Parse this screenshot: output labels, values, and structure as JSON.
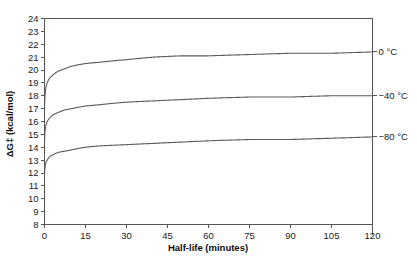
{
  "chart_data": {
    "type": "line",
    "title": "",
    "xlabel": "Half-life (minutes)",
    "ylabel": "ΔG‡ (kcal/mol)",
    "xlim": [
      0,
      120
    ],
    "ylim": [
      8,
      24
    ],
    "xticks": [
      "0",
      "15",
      "30",
      "45",
      "60",
      "75",
      "90",
      "105",
      "120"
    ],
    "xtick_values": [
      0,
      15,
      30,
      45,
      60,
      75,
      90,
      105,
      120
    ],
    "yticks": [
      "8",
      "9",
      "10",
      "11",
      "12",
      "13",
      "14",
      "15",
      "16",
      "17",
      "18",
      "19",
      "20",
      "21",
      "22",
      "23",
      "24"
    ],
    "ytick_values": [
      8,
      9,
      10,
      11,
      12,
      13,
      14,
      15,
      16,
      17,
      18,
      19,
      20,
      21,
      22,
      23,
      24
    ],
    "grid": false,
    "legend_position": "right-inline",
    "series": [
      {
        "name": "0 °C",
        "label": "0 °C",
        "color": "#5a5a5a",
        "x": [
          0.05,
          0.25,
          0.5,
          1,
          2,
          3,
          5,
          7.5,
          10,
          15,
          20,
          30,
          40,
          50,
          60,
          75,
          90,
          105,
          120
        ],
        "values": [
          17.3,
          18.2,
          18.6,
          19.0,
          19.4,
          19.6,
          19.9,
          20.1,
          20.3,
          20.5,
          20.6,
          20.8,
          21.0,
          21.1,
          21.1,
          21.2,
          21.3,
          21.3,
          21.4
        ]
      },
      {
        "name": "-40 °C",
        "label": "−40 °C",
        "color": "#5a5a5a",
        "x": [
          0.05,
          0.25,
          0.5,
          1,
          2,
          3,
          5,
          7.5,
          10,
          15,
          20,
          30,
          40,
          50,
          60,
          75,
          90,
          105,
          120
        ],
        "values": [
          14.6,
          15.3,
          15.7,
          16.0,
          16.3,
          16.5,
          16.7,
          16.9,
          17.0,
          17.2,
          17.3,
          17.5,
          17.6,
          17.7,
          17.8,
          17.9,
          17.9,
          18.0,
          18.0
        ]
      },
      {
        "name": "-80 °C",
        "label": "−80 °C",
        "color": "#5a5a5a",
        "x": [
          0.05,
          0.25,
          0.5,
          1,
          2,
          3,
          5,
          7.5,
          10,
          15,
          20,
          30,
          40,
          50,
          60,
          75,
          90,
          105,
          120
        ],
        "values": [
          11.9,
          12.5,
          12.8,
          13.0,
          13.3,
          13.4,
          13.6,
          13.7,
          13.8,
          14.0,
          14.1,
          14.2,
          14.3,
          14.4,
          14.5,
          14.6,
          14.6,
          14.7,
          14.8
        ]
      }
    ],
    "annotations": []
  },
  "axes": {
    "y_title": "ΔG‡ (kcal/mol)",
    "x_title": "Half-life (minutes)"
  }
}
